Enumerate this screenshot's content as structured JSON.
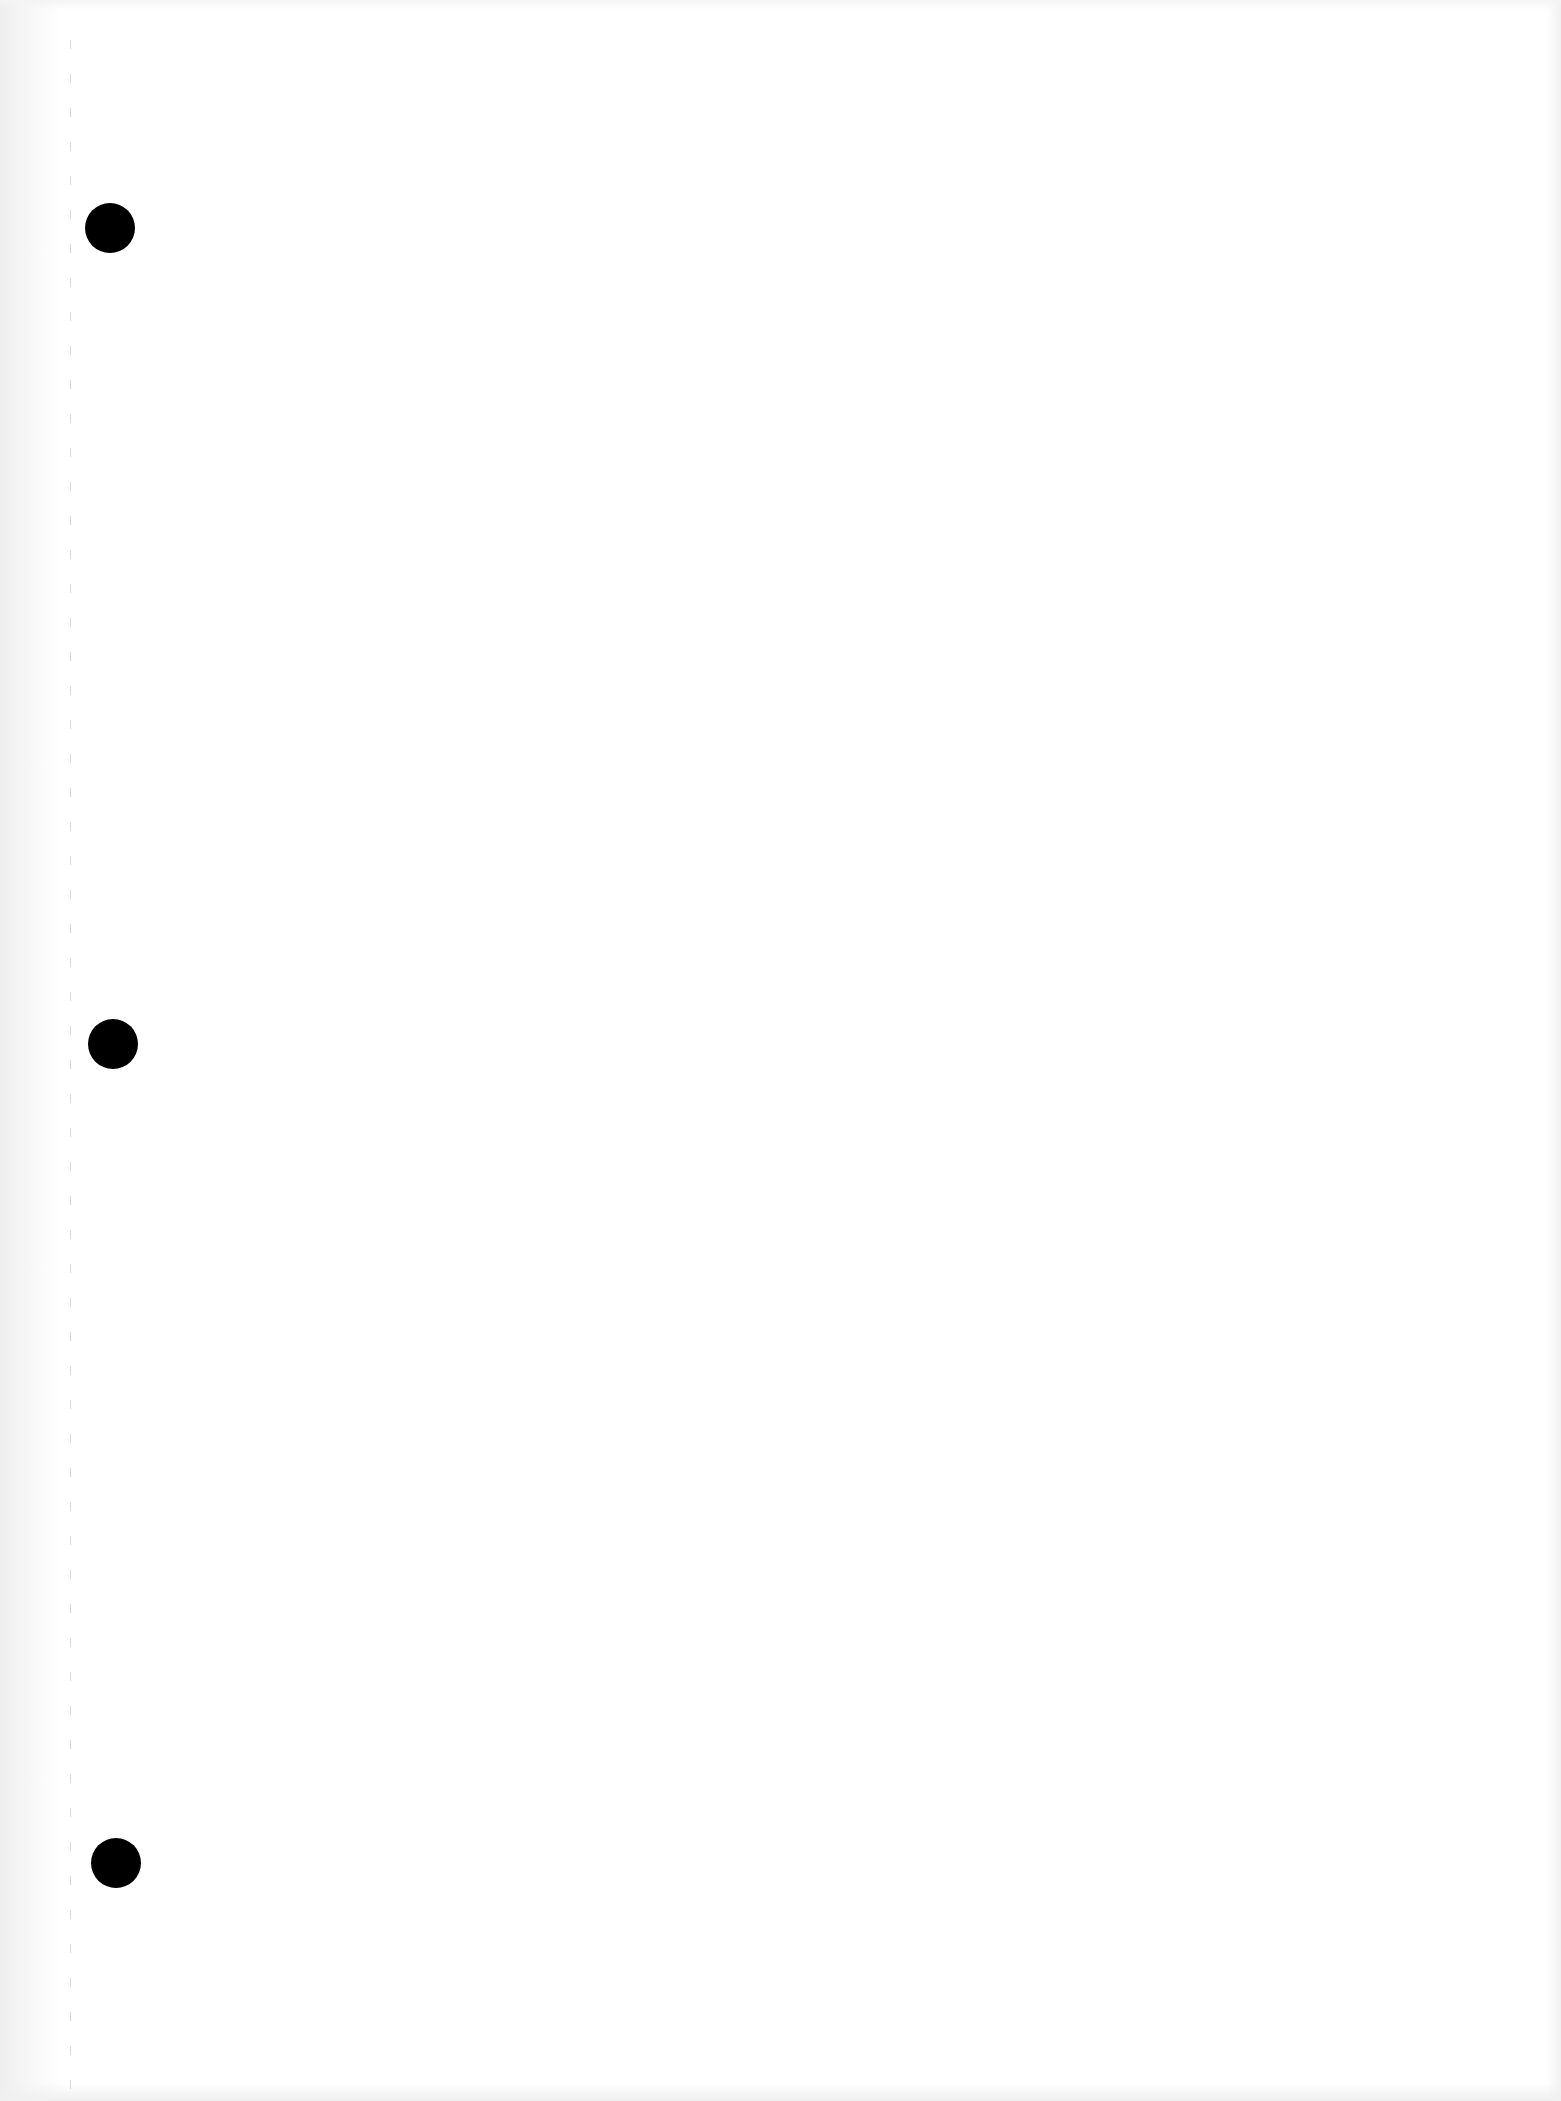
{
  "document": {
    "type": "blank three-hole punched sheet",
    "text_content": [],
    "punch_holes": [
      {
        "label": "top",
        "x": 110,
        "y": 228
      },
      {
        "label": "middle",
        "x": 113,
        "y": 1044
      },
      {
        "label": "bottom",
        "x": 116,
        "y": 1863
      }
    ],
    "colors": {
      "paper": "#ffffff",
      "hole": "#000000",
      "perforation": "#d2d2d2"
    }
  }
}
